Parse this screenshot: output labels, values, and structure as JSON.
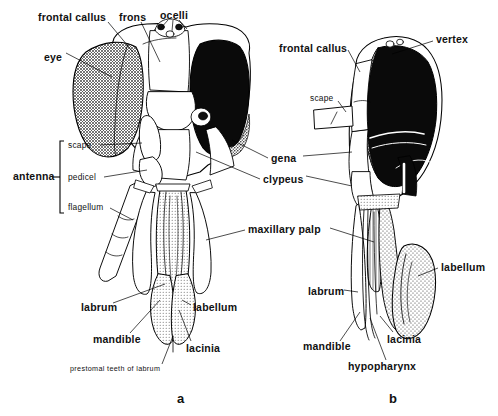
{
  "figure": {
    "background_color": "#ffffff",
    "ink_color": "#000000"
  },
  "panels": [
    {
      "id": "a",
      "letter": "a",
      "view": "anterior (frontal) view of head",
      "x": 177,
      "y": 392
    },
    {
      "id": "b",
      "letter": "b",
      "view": "lateral (side) view of head",
      "x": 389,
      "y": 392
    }
  ],
  "panel_a": {
    "labels": [
      {
        "text": "frontal  callus",
        "style": "main",
        "x": 38,
        "y": 12,
        "anchor": "start"
      },
      {
        "text": "frons",
        "style": "main",
        "x": 119,
        "y": 12,
        "anchor": "start"
      },
      {
        "text": "ocelli",
        "style": "main",
        "x": 160,
        "y": 10,
        "anchor": "start"
      },
      {
        "text": "eye",
        "style": "main",
        "x": 44,
        "y": 52,
        "anchor": "start"
      },
      {
        "text": "scape",
        "style": "sub",
        "x": 68,
        "y": 147,
        "anchor": "start"
      },
      {
        "text": "antenna",
        "style": "main",
        "x": 13,
        "y": 176,
        "anchor": "start"
      },
      {
        "text": "pedicel",
        "style": "sub",
        "x": 68,
        "y": 178,
        "anchor": "start"
      },
      {
        "text": "flagellum",
        "style": "sub",
        "x": 68,
        "y": 207,
        "anchor": "start"
      },
      {
        "text": "labrum",
        "style": "main",
        "x": 81,
        "y": 307,
        "anchor": "start"
      },
      {
        "text": "mandible",
        "style": "main",
        "x": 93,
        "y": 339,
        "anchor": "start"
      },
      {
        "text": "lacinia",
        "style": "main",
        "x": 186,
        "y": 348,
        "anchor": "start"
      },
      {
        "text": "labellum",
        "style": "main",
        "x": 193,
        "y": 307,
        "anchor": "start"
      },
      {
        "text": "prestomal  teeth  of  labrum",
        "style": "tiny",
        "x": 70,
        "y": 369,
        "anchor": "start"
      }
    ],
    "shared_labels": [
      {
        "text": "gena",
        "style": "main",
        "x": 271,
        "y": 160,
        "anchor": "start"
      },
      {
        "text": "clypeus",
        "style": "main",
        "x": 263,
        "y": 181,
        "anchor": "start"
      },
      {
        "text": "maxillary  palp",
        "style": "main",
        "x": 248,
        "y": 231,
        "anchor": "start"
      }
    ]
  },
  "panel_b": {
    "labels": [
      {
        "text": "frontal  callus",
        "style": "main",
        "x": 279,
        "y": 48,
        "anchor": "start"
      },
      {
        "text": "vertex",
        "style": "main",
        "x": 436,
        "y": 39,
        "anchor": "start"
      },
      {
        "text": "scape",
        "style": "sub",
        "x": 310,
        "y": 99,
        "anchor": "start"
      },
      {
        "text": "labellum",
        "style": "main",
        "x": 441,
        "y": 267,
        "anchor": "start"
      },
      {
        "text": "labrum",
        "style": "main",
        "x": 308,
        "y": 291,
        "anchor": "start"
      },
      {
        "text": "mandible",
        "style": "main",
        "x": 303,
        "y": 346,
        "anchor": "start"
      },
      {
        "text": "lacinia",
        "style": "main",
        "x": 387,
        "y": 339,
        "anchor": "start"
      },
      {
        "text": "hypopharynx",
        "style": "main",
        "x": 348,
        "y": 366,
        "anchor": "start"
      }
    ]
  },
  "anatomy_parts": {
    "head_sclerites": [
      "frontal callus",
      "frons",
      "vertex",
      "gena",
      "clypeus",
      "ocelli"
    ],
    "eyes": [
      "compound eye (left, stippled)",
      "compound eye (right, solid black)"
    ],
    "antenna_segments": [
      "scape",
      "pedicel",
      "flagellum"
    ],
    "mouthparts": [
      "labrum",
      "mandible",
      "lacinia",
      "labellum",
      "maxillary palp",
      "hypopharynx",
      "prestomal teeth of labrum"
    ]
  }
}
